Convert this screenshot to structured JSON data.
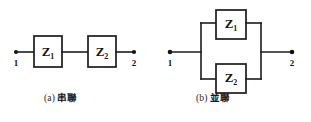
{
  "figure": {
    "background_color": "#ffffff",
    "ink_color": "#1c1c1c",
    "panels": [
      {
        "id": "series",
        "tag": "(a)",
        "caption": "串聯",
        "terminals": [
          {
            "label": "1",
            "side": "left"
          },
          {
            "label": "2",
            "side": "right"
          }
        ],
        "components": [
          {
            "symbol": "Z",
            "subscript": "1"
          },
          {
            "symbol": "Z",
            "subscript": "2"
          }
        ]
      },
      {
        "id": "parallel",
        "tag": "(b)",
        "caption": "並聯",
        "terminals": [
          {
            "label": "1",
            "side": "left"
          },
          {
            "label": "2",
            "side": "right"
          }
        ],
        "components": [
          {
            "symbol": "Z",
            "subscript": "1"
          },
          {
            "symbol": "Z",
            "subscript": "2"
          }
        ]
      }
    ]
  }
}
